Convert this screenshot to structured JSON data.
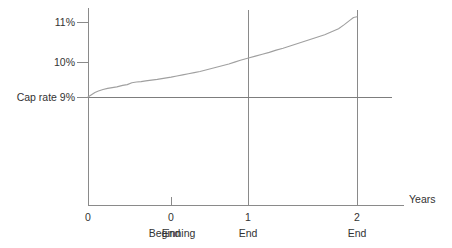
{
  "chart_data": {
    "type": "line",
    "title": "",
    "subtitle": "",
    "xlabel": "Years",
    "ylabel": "",
    "grid": "vertical gridlines at x=1 End and x=2 End; horizontal reference line at 9%",
    "legend": "none",
    "xlim": [
      0,
      2.45
    ],
    "ylim": [
      7.6,
      11.45
    ],
    "y_ticks": [
      {
        "value": 11,
        "label": "11%"
      },
      {
        "value": 10,
        "label": "10%"
      },
      {
        "value": 9,
        "label": "Cap rate 9%"
      }
    ],
    "x_ticks": [
      {
        "value": 0,
        "number": "0",
        "period": "Beginning"
      },
      {
        "value": 0.72,
        "number": "0",
        "period": "End"
      },
      {
        "value": 1.39,
        "number": "1",
        "period": "End"
      },
      {
        "value": 2.33,
        "number": "2",
        "period": "End"
      }
    ],
    "reference_line": {
      "name": "Cap rate",
      "value": 9,
      "label": "Cap rate 9%"
    },
    "series": [
      {
        "name": "Yield rate",
        "color": "#a0a0a0",
        "x": [
          0.0,
          0.03,
          0.06,
          0.09,
          0.13,
          0.17,
          0.21,
          0.25,
          0.3,
          0.34,
          0.38,
          0.42,
          0.46,
          0.5,
          0.55,
          0.6,
          0.64,
          0.68,
          0.72,
          0.77,
          0.82,
          0.87,
          0.92,
          0.97,
          1.02,
          1.07,
          1.12,
          1.17,
          1.22,
          1.27,
          1.32,
          1.39,
          1.45,
          1.51,
          1.57,
          1.63,
          1.69,
          1.75,
          1.81,
          1.87,
          1.93,
          1.99,
          2.05,
          2.11,
          2.17,
          2.22,
          2.27,
          2.3,
          2.33
        ],
        "y": [
          9.0,
          9.06,
          9.12,
          9.16,
          9.2,
          9.23,
          9.25,
          9.27,
          9.31,
          9.33,
          9.38,
          9.4,
          9.41,
          9.43,
          9.45,
          9.47,
          9.49,
          9.51,
          9.53,
          9.56,
          9.59,
          9.62,
          9.65,
          9.68,
          9.72,
          9.76,
          9.8,
          9.84,
          9.88,
          9.93,
          9.98,
          10.04,
          10.09,
          10.14,
          10.19,
          10.25,
          10.3,
          10.36,
          10.42,
          10.48,
          10.54,
          10.6,
          10.66,
          10.74,
          10.82,
          10.93,
          11.05,
          11.12,
          11.14
        ]
      }
    ]
  }
}
